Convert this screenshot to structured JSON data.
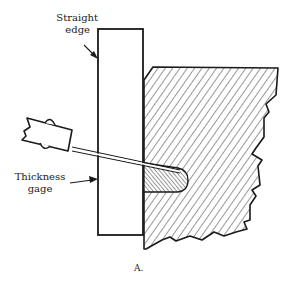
{
  "figure": {
    "caption": "A.",
    "labels": {
      "straight_edge": {
        "line1": "Straight",
        "line2": "edge"
      },
      "thickness_gage": {
        "line1": "Thickness",
        "line2": "gage"
      }
    },
    "components": [
      "straight-edge",
      "thickness-gage",
      "workpiece-surface",
      "surface-gap"
    ],
    "colors": {
      "ink": "#1a1a1a",
      "background": "#ffffff"
    }
  }
}
